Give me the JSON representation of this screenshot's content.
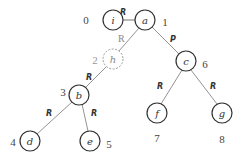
{
  "diagram": {
    "type": "tree",
    "colors": {
      "stroke": "#333333",
      "ghost": "#999999",
      "edge": "#777777"
    },
    "nodes": [
      {
        "id": "i",
        "label": "i",
        "index": "0",
        "x": 113,
        "y": 20,
        "dashed": false
      },
      {
        "id": "a",
        "label": "a",
        "index": "1",
        "x": 145,
        "y": 20,
        "dashed": false
      },
      {
        "id": "h",
        "label": "h",
        "index": "2",
        "x": 113,
        "y": 59,
        "dashed": true
      },
      {
        "id": "b",
        "label": "b",
        "index": "3",
        "x": 79,
        "y": 95,
        "dashed": false
      },
      {
        "id": "d",
        "label": "d",
        "index": "4",
        "x": 30,
        "y": 141,
        "dashed": false
      },
      {
        "id": "e",
        "label": "e",
        "index": "5",
        "x": 90,
        "y": 141,
        "dashed": false
      },
      {
        "id": "c",
        "label": "c",
        "index": "6",
        "x": 186,
        "y": 61,
        "dashed": false
      },
      {
        "id": "f",
        "label": "f",
        "index": "7",
        "x": 157,
        "y": 113,
        "dashed": false
      },
      {
        "id": "g",
        "label": "g",
        "index": "8",
        "x": 222,
        "y": 113,
        "dashed": false
      }
    ],
    "edges": [
      {
        "from": "i",
        "to": "a",
        "label": "R"
      },
      {
        "from": "a",
        "to": "h",
        "label": "R"
      },
      {
        "from": "a",
        "to": "c",
        "label": "P"
      },
      {
        "from": "h",
        "to": "b",
        "label": "R"
      },
      {
        "from": "b",
        "to": "d",
        "label": "R"
      },
      {
        "from": "b",
        "to": "e",
        "label": "R"
      },
      {
        "from": "c",
        "to": "f",
        "label": "R"
      },
      {
        "from": "c",
        "to": "g",
        "label": "R"
      }
    ]
  }
}
